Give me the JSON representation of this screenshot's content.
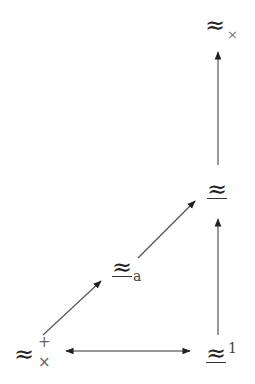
{
  "diagram": {
    "type": "commutative-diagram",
    "nodes": {
      "top": {
        "symbol": "≈",
        "subscript": "×"
      },
      "right_mid": {
        "symbol": "≈",
        "underlined": true
      },
      "left_mid": {
        "symbol": "≈",
        "underlined": true,
        "subscript": "a"
      },
      "bottom_left": {
        "symbol": "≈",
        "superscript": "+",
        "subscript": "×"
      },
      "bottom_right": {
        "symbol": "≈",
        "underlined": true,
        "superscript": "1"
      }
    },
    "edges": [
      {
        "from": "bottom_left",
        "to": "bottom_right",
        "style": "bidirectional"
      },
      {
        "from": "bottom_left",
        "to": "left_mid",
        "style": "arrow"
      },
      {
        "from": "left_mid",
        "to": "right_mid",
        "style": "arrow"
      },
      {
        "from": "bottom_right",
        "to": "right_mid",
        "style": "arrow"
      },
      {
        "from": "right_mid",
        "to": "top",
        "style": "arrow"
      }
    ],
    "colors": {
      "line": "#333333",
      "symbol": "#222222",
      "script": "#777777"
    }
  }
}
